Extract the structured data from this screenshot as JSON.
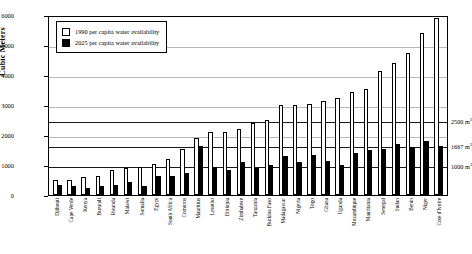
{
  "chart_data": {
    "type": "bar",
    "title": "",
    "xlabel": "",
    "ylabel": "Cubic Meters",
    "ylim": [
      0,
      6000
    ],
    "ytick_step": 1000,
    "yticks": [
      0,
      1000,
      2000,
      3000,
      4000,
      5000,
      6000
    ],
    "ytick_labels": [
      "0",
      "1000",
      "2000",
      "3000",
      "4000",
      "5000",
      "6000"
    ],
    "grid": true,
    "legend_position": "top-left",
    "categories": [
      "Djibouti",
      "Cape Verde",
      "Kenya",
      "Burundi",
      "Rwanda",
      "Malawi",
      "Somalia",
      "Egypt",
      "South Africa",
      "Comoros",
      "Mauritius",
      "Lesotho",
      "Ethiopia",
      "Zimbabwe",
      "Tanzania",
      "Burkina Faso",
      "Madagascar",
      "Nigeria",
      "Togo",
      "Ghana",
      "Uganda",
      "Mozambique",
      "Mauritania",
      "Senegal",
      "Sudan",
      "Benin",
      "Niger",
      "Cote d'Ivoire"
    ],
    "series": [
      {
        "name": "1990 per capita water availability",
        "fill": "#ffffff",
        "edge": "#000000",
        "values": [
          500,
          500,
          600,
          650,
          850,
          900,
          950,
          1050,
          1200,
          1550,
          1900,
          2100,
          2100,
          2200,
          2400,
          2500,
          3000,
          3000,
          3050,
          3150,
          3250,
          3450,
          3550,
          4150,
          4400,
          4750,
          5400,
          5900
        ]
      },
      {
        "name": "2025 per capita water availability",
        "fill": "#000000",
        "edge": "#000000",
        "values": [
          350,
          300,
          250,
          300,
          350,
          450,
          300,
          650,
          650,
          750,
          1650,
          950,
          850,
          1100,
          900,
          1000,
          1300,
          1100,
          1350,
          1150,
          1000,
          1400,
          1500,
          1550,
          1700,
          1600,
          1800,
          1650
        ]
      }
    ],
    "threshold_lines": [
      {
        "label": "2500 m",
        "unit_exponent": "3",
        "value": 2500
      },
      {
        "label": "1667 m",
        "unit_exponent": "3",
        "value": 1667
      },
      {
        "label": "1000 m",
        "unit_exponent": "3",
        "value": 1000
      }
    ]
  }
}
